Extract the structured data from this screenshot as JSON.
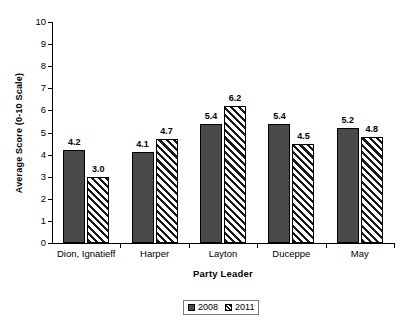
{
  "chart_data": {
    "type": "bar",
    "title": "",
    "xlabel": "Party Leader",
    "ylabel": "Average Score (0-10 Scale)",
    "categories": [
      "Dion, Ignatieff",
      "Harper",
      "Layton",
      "Duceppe",
      "May"
    ],
    "series": [
      {
        "name": "2008",
        "values": [
          4.2,
          4.1,
          5.4,
          5.4,
          5.2
        ],
        "color": "#4a4a4a",
        "fill": "solid"
      },
      {
        "name": "2011",
        "values": [
          3.0,
          4.7,
          6.2,
          4.5,
          4.8
        ],
        "color": "#1a1a1a",
        "fill": "diagonal-hatch"
      }
    ],
    "value_labels": [
      [
        "4.2",
        "3.0"
      ],
      [
        "4.1",
        "4.7"
      ],
      [
        "5.4",
        "6.2"
      ],
      [
        "5.4",
        "4.5"
      ],
      [
        "5.2",
        "4.8"
      ]
    ],
    "ylim": [
      0,
      10
    ],
    "ytick_labels": [
      "10",
      "9",
      "8",
      "7",
      "6",
      "5",
      "4",
      "3",
      "2",
      "1",
      "0"
    ],
    "ytick_values": [
      10,
      9,
      8,
      7,
      6,
      5,
      4,
      3,
      2,
      1,
      0
    ],
    "grid": false,
    "legend_position": "bottom-center",
    "data_labels_shown": true
  },
  "legend": {
    "entries": [
      {
        "label": "2008"
      },
      {
        "label": "2011"
      }
    ]
  },
  "axes": {
    "y_title": "Average Score (0-10 Scale)",
    "x_title": "Party Leader"
  }
}
